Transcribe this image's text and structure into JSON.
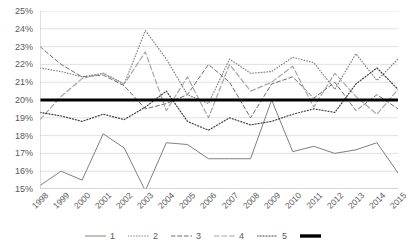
{
  "chart_data": {
    "type": "line",
    "title": "",
    "subtitle": "",
    "xlabel": "",
    "ylabel": "",
    "grid": true,
    "legend_position": "bottom",
    "ylim": [
      15,
      25
    ],
    "ytick_step": 1,
    "ytick_labels": [
      "25%",
      "24%",
      "23%",
      "22%",
      "21%",
      "20%",
      "19%",
      "18%",
      "17%",
      "16%",
      "15%"
    ],
    "ytick_values": [
      25,
      24,
      23,
      22,
      21,
      20,
      19,
      18,
      17,
      16,
      15
    ],
    "categories": [
      "1998",
      "1999",
      "2000",
      "2001",
      "2002",
      "2003",
      "2004",
      "2005",
      "2006",
      "2007",
      "2008",
      "2009",
      "2010",
      "2011",
      "2012",
      "2013",
      "2014",
      "2015"
    ],
    "series": [
      {
        "name": "1",
        "style": "solid",
        "color": "#808080",
        "width": 1,
        "values": [
          15.2,
          16.0,
          15.5,
          18.1,
          17.3,
          14.9,
          17.6,
          17.5,
          16.7,
          16.7,
          16.7,
          20.0,
          17.1,
          17.4,
          17.0,
          17.2,
          17.6,
          15.9
        ]
      },
      {
        "name": "2",
        "style": "dotted",
        "color": "#7f7f7f",
        "width": 1.2,
        "values": [
          21.8,
          21.6,
          21.3,
          21.5,
          20.9,
          23.9,
          22.3,
          20.3,
          19.8,
          22.3,
          21.5,
          21.6,
          22.4,
          22.1,
          20.6,
          22.6,
          21.1,
          22.3
        ]
      },
      {
        "name": "3",
        "style": "dashed",
        "color": "#6e6e6e",
        "width": 1,
        "values": [
          23.0,
          22.0,
          21.3,
          21.4,
          20.8,
          19.5,
          19.8,
          20.3,
          22.0,
          21.0,
          19.0,
          20.9,
          21.3,
          20.1,
          21.0,
          19.4,
          20.3,
          19.5
        ]
      },
      {
        "name": "4",
        "style": "dashed-light",
        "color": "#a6a6a6",
        "width": 1.2,
        "values": [
          18.9,
          20.2,
          21.2,
          21.5,
          20.9,
          22.7,
          19.4,
          21.3,
          19.0,
          22.0,
          20.5,
          21.0,
          21.9,
          19.6,
          21.5,
          20.2,
          19.2,
          20.6
        ]
      },
      {
        "name": "5",
        "style": "dotted-dark",
        "color": "#404040",
        "width": 1.2,
        "values": [
          19.3,
          19.1,
          18.8,
          19.2,
          18.9,
          19.6,
          20.5,
          18.8,
          18.3,
          19.0,
          18.6,
          18.8,
          19.2,
          19.5,
          19.3,
          20.9,
          21.8,
          20.6
        ]
      },
      {
        "name": "",
        "style": "thick-solid",
        "color": "#000000",
        "width": 3.2,
        "values": [
          20.0,
          20.0,
          20.0,
          20.0,
          20.0,
          20.0,
          20.0,
          20.0,
          20.0,
          20.0,
          20.0,
          20.0,
          20.0,
          20.0,
          20.0,
          20.0,
          20.0,
          20.0
        ]
      }
    ],
    "legend_entries": [
      {
        "label": "1",
        "style": "solid",
        "color": "#808080"
      },
      {
        "label": "2",
        "style": "dotted",
        "color": "#7f7f7f"
      },
      {
        "label": "3",
        "style": "dashed",
        "color": "#6e6e6e"
      },
      {
        "label": "4",
        "style": "dashed-light",
        "color": "#a6a6a6"
      },
      {
        "label": "5",
        "style": "dotted-dark",
        "color": "#404040"
      },
      {
        "label": "",
        "style": "thick-solid",
        "color": "#000000"
      }
    ],
    "colors": {
      "grid": "#d9d9d9",
      "axis": "#bfbfbf",
      "text": "#595959",
      "background": "#ffffff"
    }
  }
}
